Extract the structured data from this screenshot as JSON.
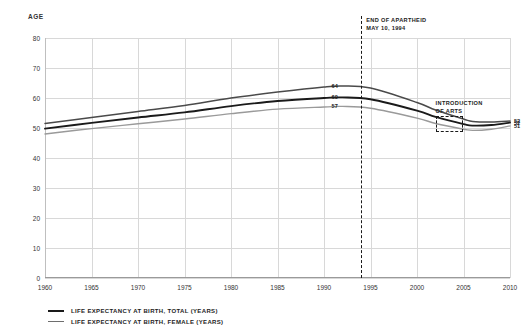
{
  "chart_data": {
    "type": "line",
    "title": "",
    "xlabel": "",
    "ylabel": "AGE",
    "xlim": [
      1960,
      2010
    ],
    "ylim": [
      0,
      80
    ],
    "grid": true,
    "legend_position": "bottom-left",
    "x": [
      1960,
      1965,
      1970,
      1975,
      1980,
      1985,
      1990,
      1992,
      1995,
      2000,
      2002,
      2005,
      2006,
      2008,
      2010
    ],
    "xticks": [
      "1960",
      "1965",
      "1970",
      "1975",
      "1980",
      "1985",
      "1990",
      "1995",
      "2000",
      "2005",
      "2010"
    ],
    "yticks": [
      "0",
      "10",
      "20",
      "30",
      "40",
      "50",
      "60",
      "70",
      "80"
    ],
    "series": [
      {
        "name": "LIFE EXPECTANCY AT BIRTH, FEMALE (YEARS)",
        "color": "#4a4a4a",
        "width": 1.5,
        "values": [
          51.5,
          53.5,
          55.5,
          57.5,
          60.0,
          62.0,
          63.7,
          64.0,
          63.3,
          58.5,
          56.0,
          53.0,
          52.2,
          52.0,
          52.3
        ]
      },
      {
        "name": "LIFE EXPECTANCY AT BIRTH, TOTAL (YEARS)",
        "color": "#1a1a1a",
        "width": 1.9,
        "values": [
          49.8,
          51.7,
          53.5,
          55.2,
          57.3,
          59.0,
          60.0,
          60.2,
          59.6,
          55.8,
          53.7,
          51.3,
          50.8,
          51.0,
          51.8
        ]
      },
      {
        "name": "LIFE EXPECTANCY AT BIRTH, MALE (YEARS)",
        "color": "#9a9a9a",
        "width": 1.4,
        "values": [
          48.0,
          49.8,
          51.4,
          53.0,
          54.8,
          56.3,
          57.0,
          57.2,
          56.6,
          53.3,
          51.5,
          49.6,
          49.2,
          49.6,
          50.7
        ]
      }
    ],
    "point_labels": [
      {
        "text": "64",
        "x": 1992,
        "y": 64.0
      },
      {
        "text": "60",
        "x": 1992,
        "y": 60.2
      },
      {
        "text": "57",
        "x": 1992,
        "y": 57.2
      },
      {
        "text": "52",
        "x": 2010,
        "y": 52.3
      },
      {
        "text": "52",
        "x": 2010,
        "y": 51.8
      },
      {
        "text": "51",
        "x": 2010,
        "y": 50.7
      }
    ],
    "annotations": [
      {
        "kind": "vline",
        "name": "end-of-apartheid",
        "x": 1994,
        "label_line1": "END OF APARTHEID",
        "label_line2": "MAY 10, 1994"
      },
      {
        "kind": "box",
        "name": "introduction-of-arts",
        "x_start": 2002,
        "x_end": 2005,
        "y_bottom": 48.6,
        "y_top": 54.0,
        "label_line1": "INTRODUCTION",
        "label_line2": "OF ARTS"
      }
    ],
    "legend": [
      {
        "label": "LIFE EXPECTANCY AT BIRTH, TOTAL (YEARS)",
        "color": "#1a1a1a",
        "width": 2.4
      },
      {
        "label": "LIFE EXPECTANCY AT BIRTH, FEMALE (YEARS)",
        "color": "#6e6e6e",
        "width": 1.8
      }
    ]
  }
}
